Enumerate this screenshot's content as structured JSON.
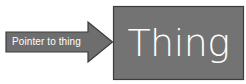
{
  "diagram": {
    "type": "pointer-to-box",
    "background_color": "#ffffff",
    "arrow": {
      "label": "Pointer to thing",
      "fill_color": "#6e6e6e",
      "stroke_color": "#3c3c3c",
      "label_color": "#ffffff",
      "direction": "right",
      "tail": {
        "x": 6,
        "y": 32,
        "width": 84,
        "height": 20
      },
      "head": {
        "x": 88,
        "y": 22,
        "width": 25,
        "height": 40
      }
    },
    "box": {
      "label": "Thing",
      "fill_color": "#737373",
      "stroke_color": "#3c3c3c",
      "label_color": "#ffffff",
      "x": 113,
      "y": 6,
      "width": 131,
      "height": 74
    }
  }
}
